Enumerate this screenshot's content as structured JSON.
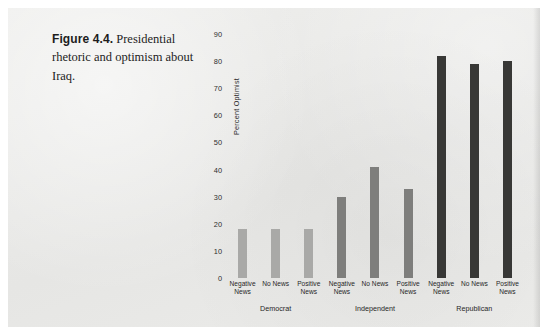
{
  "caption": {
    "figure_number": "Figure 4.4.",
    "text": "Presidential rhetoric and optimism about Iraq."
  },
  "chart_data": {
    "type": "bar",
    "title": "",
    "xlabel": "",
    "ylabel": "Percent Optimist",
    "ylim": [
      0,
      90
    ],
    "yticks": [
      0,
      10,
      20,
      30,
      40,
      50,
      60,
      70,
      80,
      90
    ],
    "grid": false,
    "legend": "none",
    "groups": [
      {
        "name": "Democrat",
        "color": "#a9a9a7",
        "categories": [
          "Negative\nNews",
          "No News",
          "Positive\nNews"
        ],
        "values": [
          18,
          18,
          18
        ]
      },
      {
        "name": "Independent",
        "color": "#7e7e7c",
        "categories": [
          "Negative\nNews",
          "No News",
          "Positive\nNews"
        ],
        "values": [
          30,
          41,
          33
        ]
      },
      {
        "name": "Republican",
        "color": "#383836",
        "categories": [
          "Negative\nNews",
          "No News",
          "Positive\nNews"
        ],
        "values": [
          82,
          79,
          80
        ]
      }
    ],
    "categories": [
      "Negative\nNews",
      "No News",
      "Positive\nNews",
      "Negative\nNews",
      "No News",
      "Positive\nNews",
      "Negative\nNews",
      "No News",
      "Positive\nNews"
    ],
    "values": [
      18,
      18,
      18,
      30,
      41,
      33,
      82,
      79,
      80
    ],
    "colors": [
      "#a9a9a7",
      "#7e7e7c",
      "#383836"
    ]
  }
}
